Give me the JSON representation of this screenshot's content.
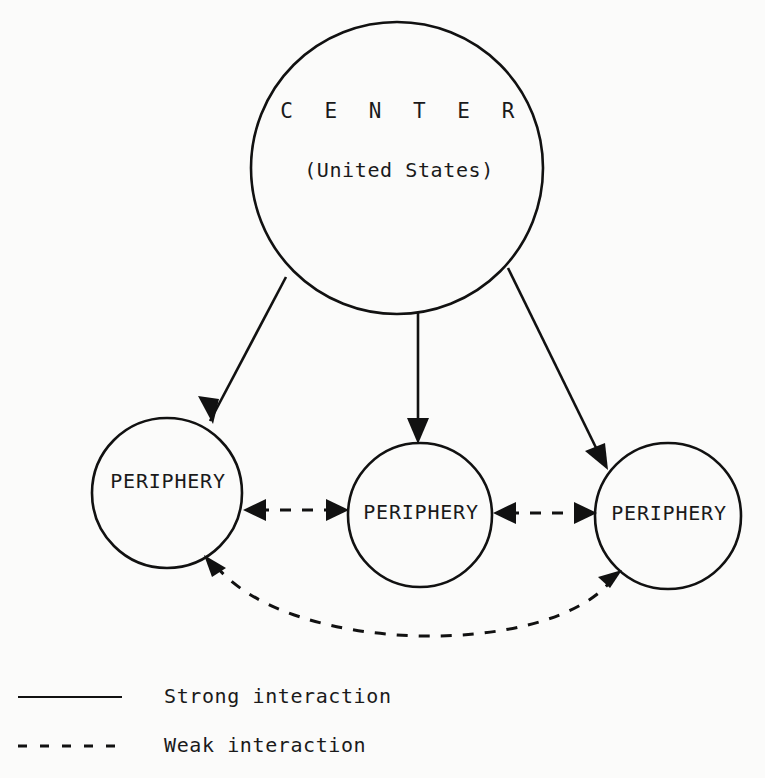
{
  "diagram": {
    "background_color": "#fbfbfa",
    "ink_color": "#111111",
    "nodes": {
      "center": {
        "title": "C E N T E R",
        "subtitle": "(United States)",
        "cx": 397,
        "cy": 168,
        "r": 146
      },
      "periphery_left": {
        "label": "PERIPHERY",
        "cx": 167,
        "cy": 493,
        "r": 75
      },
      "periphery_middle": {
        "label": "PERIPHERY",
        "cx": 420,
        "cy": 515,
        "r": 72
      },
      "periphery_right": {
        "label": "PERIPHERY",
        "cx": 668,
        "cy": 516,
        "r": 73
      }
    },
    "edges": [
      {
        "id": "center-to-left",
        "kind": "strong",
        "style": "solid",
        "direction": "one-way",
        "from": "center",
        "to": "periphery_left"
      },
      {
        "id": "center-to-middle",
        "kind": "strong",
        "style": "solid",
        "direction": "one-way",
        "from": "center",
        "to": "periphery_middle"
      },
      {
        "id": "center-to-right",
        "kind": "strong",
        "style": "solid",
        "direction": "one-way",
        "from": "center",
        "to": "periphery_right"
      },
      {
        "id": "left-middle",
        "kind": "weak",
        "style": "dashed",
        "direction": "two-way",
        "from": "periphery_left",
        "to": "periphery_middle"
      },
      {
        "id": "middle-right",
        "kind": "weak",
        "style": "dashed",
        "direction": "two-way",
        "from": "periphery_middle",
        "to": "periphery_right"
      },
      {
        "id": "left-right-arc",
        "kind": "weak",
        "style": "dashed",
        "direction": "two-way",
        "from": "periphery_left",
        "to": "periphery_right"
      }
    ],
    "legend": {
      "items": [
        {
          "style": "solid",
          "label": "Strong interaction"
        },
        {
          "style": "dashed",
          "label": "Weak interaction"
        }
      ]
    }
  }
}
